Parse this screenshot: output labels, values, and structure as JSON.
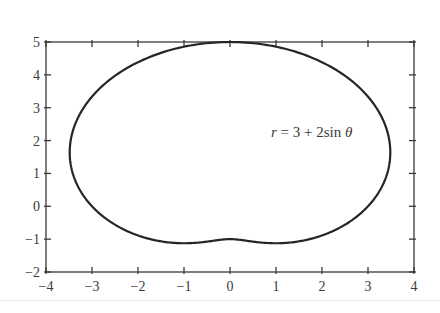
{
  "chart_data": {
    "type": "line",
    "title": "",
    "xlabel": "",
    "ylabel": "",
    "xlim": [
      -4,
      4
    ],
    "ylim": [
      -2,
      5
    ],
    "xticks": [
      -4,
      -3,
      -2,
      -1,
      0,
      1,
      2,
      3,
      4
    ],
    "yticks": [
      -2,
      -1,
      0,
      1,
      2,
      3,
      4,
      5
    ],
    "xtick_labels": [
      "−4",
      "−3",
      "−2",
      "−1",
      "0",
      "1",
      "2",
      "3",
      "4"
    ],
    "ytick_labels": [
      "−2",
      "−1",
      "0",
      "1",
      "2",
      "3",
      "4",
      "5"
    ],
    "grid": false,
    "legend": null,
    "series": [
      {
        "name": "r = 3 + 2 sin θ",
        "kind": "polar",
        "equation": {
          "a": 3,
          "b": 2,
          "func": "sin"
        },
        "theta_range": [
          0,
          6.2832
        ],
        "key_points": [
          {
            "x": 3,
            "y": 0
          },
          {
            "x": 0,
            "y": 5
          },
          {
            "x": -3,
            "y": 0
          },
          {
            "x": 0,
            "y": -1
          },
          {
            "x": 3.52,
            "y": 1.68
          },
          {
            "x": -3.52,
            "y": 1.68
          },
          {
            "x": 1.08,
            "y": -1.13
          },
          {
            "x": -1.08,
            "y": -1.13
          }
        ]
      }
    ],
    "annotations": [
      {
        "text": "r = 3 + 2sin θ",
        "x": 2.55,
        "y": 3.15
      }
    ]
  },
  "labels": {
    "annotation_r": "r",
    "annotation_rest": " = 3 + 2sin ",
    "annotation_theta": "θ"
  },
  "colors": {
    "curve": "#262626",
    "axis": "#3a3a3a",
    "background": "#ffffff"
  }
}
